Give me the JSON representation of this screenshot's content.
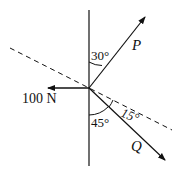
{
  "diagram": {
    "type": "force-diagram",
    "forces": {
      "P": {
        "label": "P",
        "angle_from_vertical": "30°"
      },
      "Q": {
        "label": "Q",
        "angle_from_vertical": "45°",
        "angle_from_dashed": "15°"
      },
      "left": {
        "label": "100 N"
      }
    },
    "angles": {
      "a30": "30°",
      "a45": "45°",
      "a15": "15°"
    },
    "colors": {
      "ink": "#111111",
      "background": "#ffffff"
    }
  }
}
